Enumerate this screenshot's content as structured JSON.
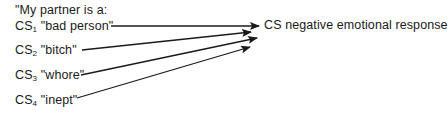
{
  "diagram": {
    "header": "\"My partner is a:",
    "stimuli": [
      {
        "prefix": "CS",
        "subscript": "1",
        "word": "\"bad person\""
      },
      {
        "prefix": "CS",
        "subscript": "2",
        "word": "\"bitch\""
      },
      {
        "prefix": "CS",
        "subscript": "3",
        "word": "\"whore\""
      },
      {
        "prefix": "CS",
        "subscript": "4",
        "word": "\"inept\""
      }
    ],
    "response": "CS negative emotional response",
    "line_color": "#1a1a1a"
  }
}
